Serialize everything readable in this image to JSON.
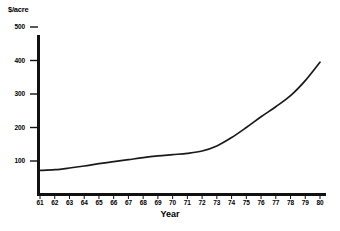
{
  "chart_data": {
    "type": "line",
    "title": "",
    "unit_label": "$/acre",
    "xlabel": "Year",
    "ylabel": "$/acre",
    "xlim": [
      61,
      80
    ],
    "ylim": [
      0,
      520
    ],
    "grid": false,
    "legend": "none",
    "y_ticks": [
      100,
      200,
      300,
      400,
      500
    ],
    "y_tick_labels": [
      "100",
      "200",
      "300",
      "400",
      "500"
    ],
    "x_ticks": [
      61,
      62,
      63,
      64,
      65,
      66,
      67,
      68,
      69,
      70,
      71,
      72,
      73,
      74,
      75,
      76,
      77,
      78,
      79,
      80
    ],
    "x_tick_labels": [
      "61",
      "62",
      "63",
      "64",
      "65",
      "66",
      "67",
      "68",
      "69",
      "70",
      "71",
      "72",
      "73",
      "74",
      "75",
      "76",
      "77",
      "78",
      "79",
      "80"
    ],
    "categories": [
      61,
      62,
      63,
      64,
      65,
      66,
      67,
      68,
      69,
      70,
      71,
      72,
      73,
      74,
      75,
      76,
      77,
      78,
      79,
      80
    ],
    "values": [
      72,
      74,
      79,
      85,
      92,
      98,
      104,
      110,
      115,
      119,
      123,
      130,
      145,
      170,
      200,
      232,
      262,
      295,
      340,
      395
    ],
    "series": [
      {
        "name": "$/acre",
        "color": "#1a1a1a",
        "values": [
          72,
          74,
          79,
          85,
          92,
          98,
          104,
          110,
          115,
          119,
          123,
          130,
          145,
          170,
          200,
          232,
          262,
          295,
          340,
          395
        ]
      }
    ],
    "annotations": []
  },
  "axis": {
    "line_color": "#111111",
    "tick_color": "#111111"
  }
}
